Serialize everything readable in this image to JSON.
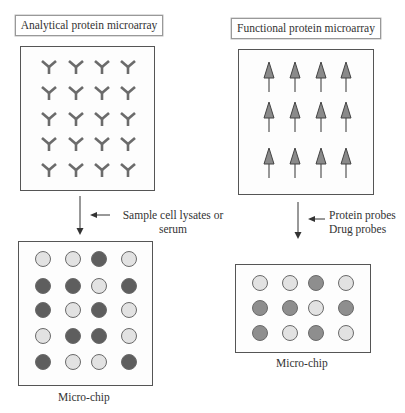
{
  "left": {
    "title": "Analytical protein microarray",
    "arrow_label_line1": "Sample cell lysates or",
    "arrow_label_line2": "serum",
    "chip_label": "Micro-chip",
    "capture_grid": {
      "rows": 5,
      "cols": 4,
      "glyph": "antibody-y"
    },
    "spots": [
      [
        "light",
        "light",
        "dark",
        "light"
      ],
      [
        "dark",
        "dark",
        "light",
        "dark"
      ],
      [
        "dark",
        "light",
        "dark",
        "light"
      ],
      [
        "light",
        "dark",
        "dark",
        "light"
      ],
      [
        "dark",
        "light",
        "light",
        "dark"
      ]
    ]
  },
  "right": {
    "title": "Functional protein microarray",
    "arrow_label_line1": "Protein probes",
    "arrow_label_line2": "Drug probes",
    "chip_label": "Micro-chip",
    "capture_grid": {
      "rows": 3,
      "cols": 4,
      "glyph": "protein-arrow"
    },
    "spots": [
      [
        "light",
        "light",
        "mid",
        "light"
      ],
      [
        "mid",
        "mid",
        "light",
        "mid"
      ],
      [
        "mid",
        "light",
        "mid",
        "light"
      ]
    ]
  },
  "colors": {
    "antibody": "#6b6b6b",
    "protein_fill": "#8a8a8a",
    "spot_light": "#e2e2e2",
    "spot_dark": "#5e5e5e",
    "spot_mid": "#8e8e8e",
    "spot_stroke": "#6a6a6a"
  }
}
